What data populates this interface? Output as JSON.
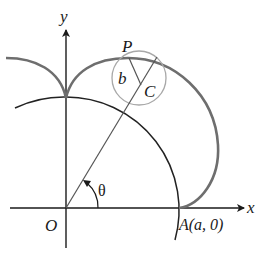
{
  "diagram": {
    "type": "epicycloid-construction",
    "labels": {
      "y_axis": "y",
      "x_axis": "x",
      "origin": "O",
      "point_p": "P",
      "radius_b": "b",
      "center_c": "C",
      "angle": "θ",
      "point_a": "A(a, 0)"
    },
    "colors": {
      "axis": "#1a1a1a",
      "fixed_circle": "#222222",
      "epicycloid": "#6e6e6e",
      "rolling_circle": "#a8a8a8",
      "line": "#555555",
      "background": "#ffffff"
    }
  }
}
